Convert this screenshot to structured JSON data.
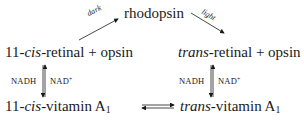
{
  "diagram": {
    "top": {
      "label": "rhodopsin"
    },
    "left_top": {
      "prefix": "11-",
      "italic": "cis",
      "suffix": "-retinal + opsin"
    },
    "right_top": {
      "italic": "trans",
      "suffix": "-retinal + opsin"
    },
    "left_bottom": {
      "prefix": "11-",
      "italic": "cis",
      "suffix": "-vitamin A",
      "subscript": "1"
    },
    "right_bottom": {
      "italic": "trans",
      "suffix": "-vitamin A",
      "subscript": "1"
    },
    "arrows": {
      "dark": "dark",
      "light": "light",
      "left_cofactor_left": "NADH",
      "left_cofactor_right": "NAD",
      "left_cofactor_right_sup": "+",
      "right_cofactor_left": "NADH",
      "right_cofactor_right": "NAD",
      "right_cofactor_right_sup": "+"
    }
  }
}
